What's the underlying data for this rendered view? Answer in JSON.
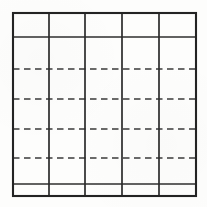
{
  "figure": {
    "name": "blank-ruled-table-grid",
    "type": "table-grid",
    "background_color": "#fdfdfc",
    "ink_color": "#232323",
    "dashed_ink_color": "#3a3a3a"
  },
  "frame": {
    "left": 13,
    "top": 13,
    "right": 196,
    "bottom": 196,
    "width": 183,
    "height": 183,
    "stroke_width": 2.1,
    "style": "solid"
  },
  "columns": {
    "count": 5,
    "divider_x": [
      49,
      85,
      122,
      159
    ],
    "edges_x": [
      13,
      49,
      85,
      122,
      159,
      196
    ],
    "stroke_width": 1.7,
    "style": "solid",
    "widths": [
      36,
      36,
      37,
      37,
      37
    ]
  },
  "rows": {
    "count": 6,
    "labels": [
      "header-row",
      "body-row-1",
      "body-row-2",
      "body-row-3",
      "body-row-4",
      "footer-row"
    ],
    "boundaries_y": [
      13,
      37,
      69,
      99,
      129,
      158,
      184,
      196
    ]
  },
  "horizontal_rules": [
    {
      "id": "rule-top-border",
      "y": 13,
      "style": "solid",
      "stroke_width": 2.1,
      "x_start": 13,
      "x_end": 196
    },
    {
      "id": "rule-header",
      "y": 37,
      "style": "solid",
      "stroke_width": 1.5,
      "x_start": 13,
      "x_end": 196
    },
    {
      "id": "rule-dashed-1",
      "y": 69,
      "style": "dashed",
      "stroke_width": 1.5,
      "x_start": 13,
      "x_end": 196
    },
    {
      "id": "rule-dashed-2",
      "y": 99,
      "style": "dashed",
      "stroke_width": 1.5,
      "x_start": 13,
      "x_end": 196
    },
    {
      "id": "rule-dashed-3",
      "y": 129,
      "style": "dashed",
      "stroke_width": 1.5,
      "x_start": 13,
      "x_end": 196
    },
    {
      "id": "rule-dashed-4",
      "y": 158,
      "style": "dashed",
      "stroke_width": 1.5,
      "x_start": 13,
      "x_end": 196
    },
    {
      "id": "rule-footer",
      "y": 184,
      "style": "solid",
      "stroke_width": 1.5,
      "x_start": 13,
      "x_end": 196
    },
    {
      "id": "rule-bottom-border",
      "y": 196,
      "style": "solid",
      "stroke_width": 2.1,
      "x_start": 13,
      "x_end": 196
    }
  ],
  "vertical_rules": [
    {
      "id": "rule-left-border",
      "x": 13,
      "style": "solid",
      "stroke_width": 2.1,
      "y_start": 13,
      "y_end": 196
    },
    {
      "id": "rule-col-1",
      "x": 49,
      "style": "solid",
      "stroke_width": 1.7,
      "y_start": 13,
      "y_end": 196
    },
    {
      "id": "rule-col-2",
      "x": 85,
      "style": "solid",
      "stroke_width": 1.7,
      "y_start": 13,
      "y_end": 196
    },
    {
      "id": "rule-col-3",
      "x": 122,
      "style": "solid",
      "stroke_width": 1.7,
      "y_start": 13,
      "y_end": 196
    },
    {
      "id": "rule-col-4",
      "x": 159,
      "style": "solid",
      "stroke_width": 1.7,
      "y_start": 13,
      "y_end": 196
    },
    {
      "id": "rule-right-border",
      "x": 196,
      "style": "solid",
      "stroke_width": 2.1,
      "y_start": 13,
      "y_end": 196
    }
  ],
  "cells": {
    "note": "All cells are blank — no text, numbers, or marks are printed in the table.",
    "content": []
  },
  "dash_pattern": {
    "dash_length": 6.5,
    "gap_length": 4.5
  }
}
